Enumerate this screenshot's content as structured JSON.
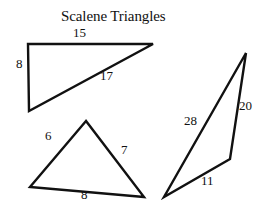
{
  "title": "Scalene Triangles",
  "stroke_color": "#111111",
  "background": "#ffffff",
  "triangles": [
    {
      "id": "right-scalene",
      "sides": [
        15,
        8,
        17
      ],
      "labels": {
        "top": "15",
        "left": "8",
        "hypotenuse": "17"
      }
    },
    {
      "id": "acute-scalene",
      "sides": [
        6,
        7,
        8
      ],
      "labels": {
        "left": "6",
        "right": "7",
        "bottom": "8"
      }
    },
    {
      "id": "obtuse-scalene",
      "sides": [
        28,
        20,
        11
      ],
      "labels": {
        "long": "28",
        "right": "20",
        "bottom": "11"
      }
    }
  ]
}
